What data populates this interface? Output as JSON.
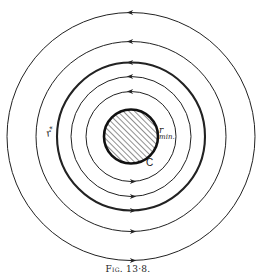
{
  "figure": {
    "caption_prefix": "Fig.",
    "caption_number": "13·8.",
    "center": {
      "x": 131,
      "y": 136.5
    },
    "core": {
      "label": "C",
      "radius": 27,
      "fill": "hatched",
      "outline_color": "#111111"
    },
    "labels": {
      "r_star": "r",
      "r_star_sup": "*",
      "r_min": "r",
      "r_min_sub": "min."
    },
    "orbits": [
      {
        "radius": 45,
        "weight": "thin",
        "direction": "counterclockwise"
      },
      {
        "radius": 60,
        "weight": "thin",
        "direction": "counterclockwise"
      },
      {
        "radius": 74,
        "weight": "bold",
        "direction": "counterclockwise",
        "label": "r*"
      },
      {
        "radius": 95,
        "weight": "thin",
        "direction": "counterclockwise"
      },
      {
        "radius": 124,
        "weight": "thin",
        "direction": "counterclockwise"
      }
    ],
    "line_color": "#222222"
  }
}
